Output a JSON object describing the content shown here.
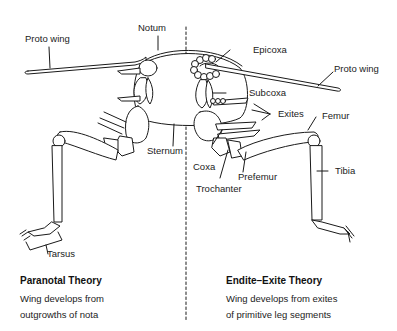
{
  "diagram": {
    "type": "anatomical-comparison",
    "divider": "dashed vertical line",
    "colors": {
      "line": "#1a1a1a",
      "fill": "#ffffff",
      "background": "#ffffff"
    }
  },
  "labels": {
    "notum": "Notum",
    "proto_wing_left": "Proto wing",
    "proto_wing_right": "Proto wing",
    "epicoxa": "Epicoxa",
    "subcoxa": "Subcoxa",
    "exites": "Exites",
    "femur": "Femur",
    "sternum": "Sternum",
    "coxa": "Coxa",
    "prefemur": "Prefemur",
    "trochanter": "Trochanter",
    "tibia": "Tibia",
    "tarsus": "Tarsus"
  },
  "theories": [
    {
      "title": "Paranotal Theory",
      "desc_line1": "Wing develops from",
      "desc_line2": "outgrowths of nota"
    },
    {
      "title": "Endite–Exite Theory",
      "desc_line1": "Wing develops from exites",
      "desc_line2": "of primitive leg segments"
    }
  ]
}
